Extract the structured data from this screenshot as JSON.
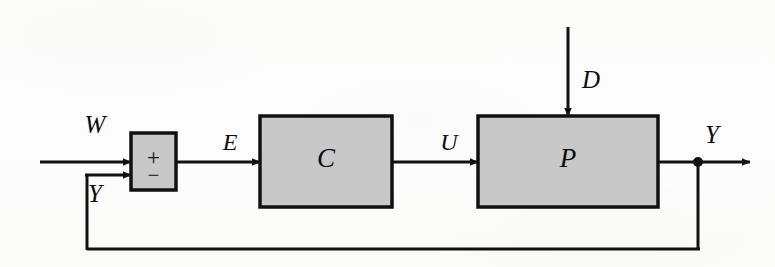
{
  "figure": {
    "kind": "control-system-block-diagram",
    "background_color": "#fdfdfc",
    "line_color": "#111111",
    "block_fill_color": "#c8c8c8",
    "block_border_color": "#111111"
  },
  "blocks": [
    {
      "id": "controller",
      "label": "C",
      "name": "controller-block",
      "x": 260,
      "y": 116,
      "width": 132,
      "height": 91,
      "fill": "#c8c8c8"
    },
    {
      "id": "plant",
      "label": "P",
      "name": "plant-block",
      "x": 478,
      "y": 116,
      "width": 180,
      "height": 91,
      "fill": "#c8c8c8"
    }
  ],
  "summing_junction": {
    "name": "summing-junction",
    "x": 131,
    "y": 133,
    "width": 45,
    "height": 57,
    "fill": "#c8c8c8",
    "plus_sign": "+",
    "minus_sign": "−"
  },
  "signals": [
    {
      "id": "reference",
      "label": "W",
      "name": "signal-label-w",
      "x": 95,
      "y": 133
    },
    {
      "id": "error",
      "label": "E",
      "name": "signal-label-e",
      "x": 230,
      "y": 150
    },
    {
      "id": "control",
      "label": "U",
      "name": "signal-label-u",
      "x": 449,
      "y": 150
    },
    {
      "id": "disturbance",
      "label": "D",
      "name": "signal-label-d",
      "x": 582,
      "y": 88
    },
    {
      "id": "output",
      "label": "Y",
      "name": "signal-label-y-output",
      "x": 712,
      "y": 143
    },
    {
      "id": "feedback",
      "label": "Y",
      "name": "signal-label-y-feedback",
      "x": 95,
      "y": 202
    }
  ],
  "geometry": {
    "main_line_y": 162,
    "minus_line_y": 175,
    "feedback_line_y": 249,
    "feedback_riser_x": 87,
    "output_node_x": 698,
    "output_node_y": 162,
    "output_node_radius": 5,
    "disturbance_x": 568,
    "disturbance_top_y": 27,
    "input_start_x": 40,
    "output_end_x": 750,
    "stroke_width": 3
  }
}
